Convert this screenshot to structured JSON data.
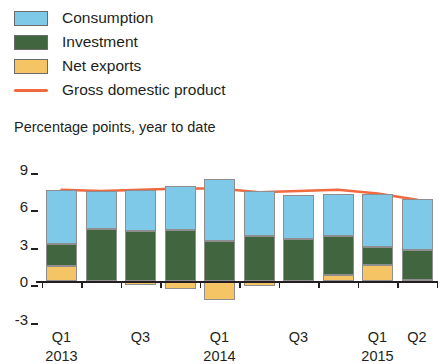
{
  "legend": {
    "items": [
      {
        "label": "Consumption",
        "marker": "swatch",
        "color": "#7fc9e8",
        "key": "consumption"
      },
      {
        "label": "Investment",
        "marker": "swatch",
        "color": "#41663f",
        "key": "investment"
      },
      {
        "label": "Net exports",
        "marker": "swatch",
        "color": "#f5c464",
        "key": "net_exports"
      },
      {
        "label": "Gross domestic product",
        "marker": "line",
        "color": "#f0693f",
        "key": "gdp"
      }
    ]
  },
  "axis": {
    "y_title": "Percentage points, year to date",
    "y_ticks": [
      "9",
      "6",
      "3",
      "0",
      "-3"
    ],
    "x_labels": [
      {
        "text": "Q1",
        "index": 0
      },
      {
        "text": "Q3",
        "index": 2
      },
      {
        "text": "Q1",
        "index": 4
      },
      {
        "text": "Q3",
        "index": 6
      },
      {
        "text": "Q1",
        "index": 8
      },
      {
        "text": "Q2",
        "index": 9
      }
    ],
    "x_years": [
      {
        "text": "2013",
        "index": 0
      },
      {
        "text": "2014",
        "index": 4
      },
      {
        "text": "2015",
        "index": 8
      }
    ]
  },
  "chart_data": {
    "type": "bar",
    "title": "",
    "subtitle": "",
    "xlabel": "",
    "ylabel": "Percentage points, year to date",
    "ylim": [
      -3,
      9
    ],
    "yticks": [
      -3,
      0,
      3,
      6,
      9
    ],
    "grid": false,
    "stacked": true,
    "legend_position": "top-left",
    "categories": [
      "Q1 2013",
      "Q2 2013",
      "Q3 2013",
      "Q4 2013",
      "Q1 2014",
      "Q2 2014",
      "Q3 2014",
      "Q4 2014",
      "Q1 2015",
      "Q2 2015"
    ],
    "series": [
      {
        "name": "Net exports",
        "color": "#f5c464",
        "values": [
          1.2,
          0.0,
          -0.3,
          -0.6,
          -1.5,
          -0.4,
          0.0,
          0.5,
          1.3,
          0.1
        ]
      },
      {
        "name": "Investment",
        "color": "#41663f",
        "values": [
          1.8,
          4.2,
          4.0,
          4.1,
          3.2,
          3.6,
          3.4,
          3.1,
          1.4,
          2.4
        ]
      },
      {
        "name": "Consumption",
        "color": "#7fc9e8",
        "values": [
          4.3,
          3.0,
          3.3,
          3.5,
          5.0,
          3.6,
          3.5,
          3.4,
          4.3,
          4.1
        ]
      }
    ],
    "line_series": [
      {
        "name": "Gross domestic product",
        "color": "#f0693f",
        "values": [
          7.3,
          7.2,
          7.3,
          7.4,
          7.4,
          7.1,
          7.2,
          7.3,
          7.0,
          6.5
        ]
      }
    ]
  },
  "geometry": {
    "plot_left": 43,
    "plot_right": 438,
    "y_zero_px": 281,
    "px_per_unit": 12.5,
    "bar_width": 31,
    "bar_gap": 8.5,
    "x_label_row_y": 330,
    "x_year_row_y": 349
  }
}
